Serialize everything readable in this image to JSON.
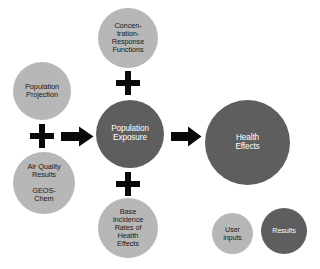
{
  "diagram": {
    "background_color": "#ffffff",
    "colors": {
      "user_input": "#b7b7b7",
      "result": "#5e5e5e",
      "connector": "#0a0a0a",
      "input_text": "#1a1a1a",
      "result_text": "#ffffff"
    },
    "nodes": {
      "population_projection": {
        "label": "Population\nProjection",
        "kind": "user-input"
      },
      "air_quality": {
        "label": "Air Quality\nResults\n\nGEOS-\nChem",
        "kind": "user-input"
      },
      "concentration_response": {
        "label": "Concen-\ntration-\nResponse\nFunctions",
        "kind": "user-input"
      },
      "base_incidence": {
        "label": "Base\nIncidence\nRates of\nHealth\nEffects",
        "kind": "user-input"
      },
      "population_exposure": {
        "label": "Population\nExposure",
        "kind": "result"
      },
      "health_effects": {
        "label": "Health\nEffects",
        "kind": "result"
      }
    },
    "connectors": {
      "plus_left": "+",
      "plus_top": "+",
      "plus_bottom": "+",
      "arrow_to_exposure": "arrow-right",
      "arrow_to_health": "arrow-right"
    },
    "legend": {
      "user_inputs": {
        "label": "User\ninputs",
        "kind": "user-input"
      },
      "results": {
        "label": "Results",
        "kind": "result"
      }
    }
  }
}
